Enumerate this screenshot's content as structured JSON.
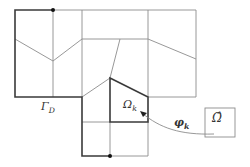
{
  "figure": {
    "type": "finite-element-mesh-diagram",
    "labels": {
      "dirichlet_boundary": {
        "symbol": "Γ",
        "subscript": "D"
      },
      "element": {
        "symbol": "Ω",
        "subscript": "k"
      },
      "mapping": {
        "symbol": "φ",
        "subscript": "k"
      },
      "reference_element": {
        "symbol": "Ω̂"
      }
    },
    "colors": {
      "thin_edge": "#8c8c8c",
      "thick_edge": "#3a3a3a",
      "background": "#ffffff"
    },
    "markers": [
      {
        "name": "boundary-point-top",
        "x": 53,
        "y": 10
      },
      {
        "name": "boundary-point-bottom",
        "x": 110,
        "y": 156
      }
    ]
  }
}
